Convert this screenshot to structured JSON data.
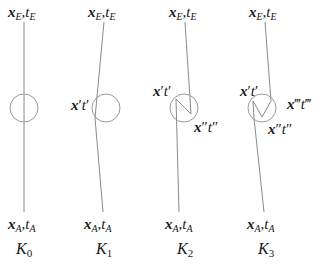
{
  "diagram": {
    "panels": [
      {
        "name": "K0",
        "label_base": "K",
        "label_sub": "0",
        "top_label": {
          "x": "x",
          "x_sub": "E",
          "sep": ",",
          "t": "t",
          "t_sub": "E"
        },
        "bottom_label": {
          "x": "x",
          "x_sub": "A",
          "sep": ",",
          "t": "t",
          "t_sub": "A"
        },
        "inner_labels": []
      },
      {
        "name": "K1",
        "label_base": "K",
        "label_sub": "1",
        "top_label": {
          "x": "x",
          "x_sub": "E",
          "sep": ",",
          "t": "t",
          "t_sub": "E"
        },
        "bottom_label": {
          "x": "x",
          "x_sub": "A",
          "sep": ",",
          "t": "t",
          "t_sub": "A"
        },
        "inner_labels": [
          "x′t′"
        ]
      },
      {
        "name": "K2",
        "label_base": "K",
        "label_sub": "2",
        "top_label": {
          "x": "x",
          "x_sub": "E",
          "sep": ",",
          "t": "t",
          "t_sub": "E"
        },
        "bottom_label": {
          "x": "x",
          "x_sub": "A",
          "sep": ",",
          "t": "t",
          "t_sub": "A"
        },
        "inner_labels": [
          "x′t′",
          "x″t″"
        ]
      },
      {
        "name": "K3",
        "label_base": "K",
        "label_sub": "3",
        "top_label": {
          "x": "x",
          "x_sub": "E",
          "sep": ",",
          "t": "t",
          "t_sub": "E"
        },
        "bottom_label": {
          "x": "x",
          "x_sub": "A",
          "sep": ",",
          "t": "t",
          "t_sub": "A"
        },
        "inner_labels": [
          "x′t′",
          "x‴t‴",
          "x″t″"
        ]
      }
    ],
    "marks": {
      "p1": {
        "x": "x",
        "xp": "′",
        "t": "t",
        "tp": "′"
      },
      "p2": {
        "x": "x",
        "xp": "″",
        "t": "t",
        "tp": "″"
      },
      "p3": {
        "x": "x",
        "xp": "‴",
        "t": "t",
        "tp": "‴"
      }
    },
    "colors": {
      "line": "#8a8a8a",
      "circle": "#9a9a9a",
      "text": "#1a1a1a"
    }
  }
}
